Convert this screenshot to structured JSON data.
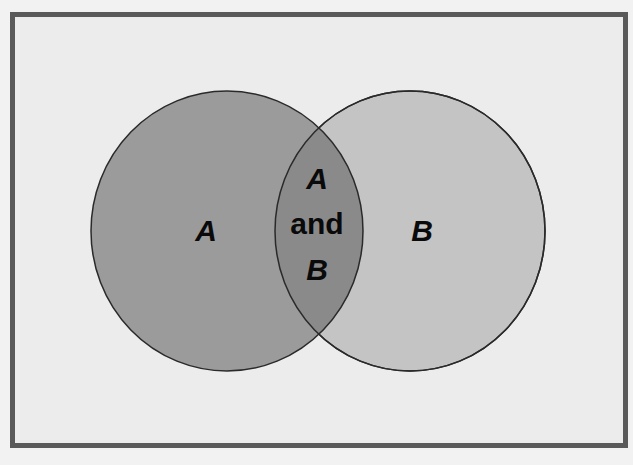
{
  "diagram": {
    "type": "venn",
    "sets": [
      {
        "id": "A",
        "label": "A",
        "fill": "#9b9b9b",
        "cx": 227,
        "cy": 231,
        "rx": 136,
        "ry": 140
      },
      {
        "id": "B",
        "label": "B",
        "fill": "#c4c4c4",
        "cx": 410,
        "cy": 231,
        "rx": 135,
        "ry": 140
      }
    ],
    "intersection": {
      "label_line1": "A",
      "label_line2": "and",
      "label_line3": "B",
      "fill": "#8a8a8a"
    },
    "colors": {
      "background": "#ececec",
      "frame_border": "#5a5a5a",
      "outline": "#2a2a2a",
      "text": "#0a0a0a"
    }
  }
}
